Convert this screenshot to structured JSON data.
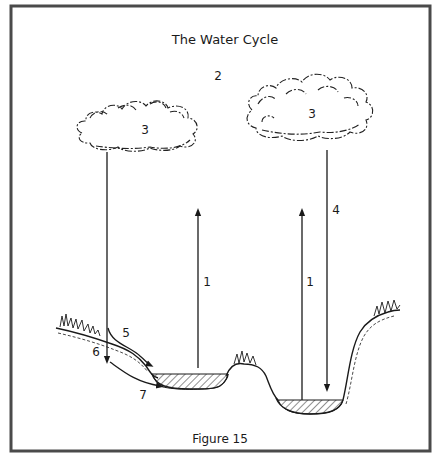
{
  "diagram": {
    "title": "The Water Cycle",
    "caption": "Figure 15",
    "colors": {
      "frame": "#4a4a4a",
      "ink": "#1a1a1a",
      "background": "#ffffff"
    },
    "labels": {
      "atmosphere": "2",
      "cloud_left": "3",
      "cloud_right": "3",
      "evaporation_left": "1",
      "evaporation_right": "1",
      "precipitation": "4",
      "surface_runoff": "5",
      "infiltration": "6",
      "groundwater_flow": "7"
    },
    "elements": {
      "clouds": [
        "cloud-left",
        "cloud-right"
      ],
      "water_bodies": [
        "pond-left",
        "lake-right"
      ],
      "arrows": [
        {
          "id": "evaporation-left",
          "label": "1",
          "direction": "up"
        },
        {
          "id": "evaporation-right",
          "label": "1",
          "direction": "up"
        },
        {
          "id": "precipitation-right",
          "label": "4",
          "direction": "down"
        },
        {
          "id": "precipitation-left",
          "label": "",
          "direction": "down"
        },
        {
          "id": "runoff",
          "label": "5",
          "direction": "downslope"
        },
        {
          "id": "groundwater",
          "label": "7",
          "direction": "downslope"
        }
      ]
    }
  }
}
